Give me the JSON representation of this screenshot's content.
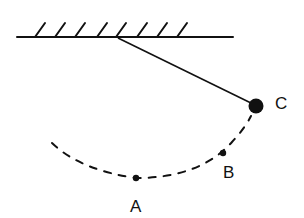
{
  "diagram": {
    "type": "pendulum",
    "colors": {
      "ink": "#111111",
      "background": "#ffffff"
    },
    "ceiling": {
      "hatch_count": 8
    },
    "points": [
      {
        "id": "A",
        "label": "A",
        "description": "lowest point of swing"
      },
      {
        "id": "B",
        "label": "B",
        "description": "intermediate point on arc"
      },
      {
        "id": "C",
        "label": "C",
        "description": "bob at maximum displacement"
      }
    ],
    "path": {
      "style": "dashed",
      "description": "arc of pendulum swing"
    }
  }
}
